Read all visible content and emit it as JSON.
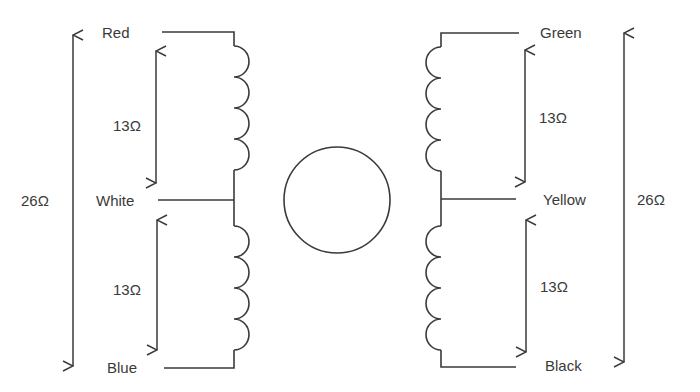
{
  "diagram": {
    "colors": {
      "line": "#3a3a3a",
      "background": "#ffffff"
    },
    "left_coil": {
      "wires": {
        "top": "Red",
        "center": "White",
        "bottom": "Blue"
      },
      "half_resistance_top": "13Ω",
      "half_resistance_bottom": "13Ω",
      "total_resistance": "26Ω"
    },
    "right_coil": {
      "wires": {
        "top": "Green",
        "center": "Yellow",
        "bottom": "Black"
      },
      "half_resistance_top": "13Ω",
      "half_resistance_bottom": "13Ω",
      "total_resistance": "26Ω"
    },
    "rotor": "motor-circle"
  }
}
